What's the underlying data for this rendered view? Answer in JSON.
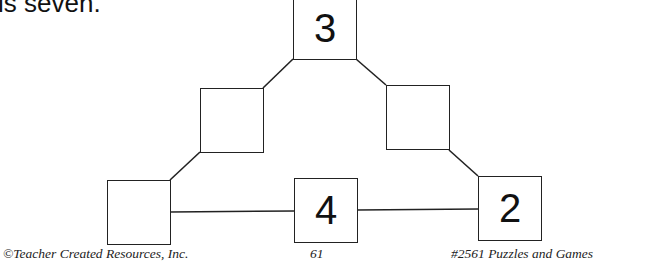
{
  "intro_text": "is seven.",
  "puzzle": {
    "boxes": [
      {
        "id": "top",
        "value": "3"
      },
      {
        "id": "left-middle",
        "value": ""
      },
      {
        "id": "right-middle",
        "value": ""
      },
      {
        "id": "bottom-left",
        "value": ""
      },
      {
        "id": "bottom-middle",
        "value": "4"
      },
      {
        "id": "bottom-right",
        "value": "2"
      }
    ]
  },
  "footer": {
    "copyright": "©Teacher Created Resources, Inc.",
    "page_number": "61",
    "book_title": "#2561 Puzzles and Games"
  }
}
